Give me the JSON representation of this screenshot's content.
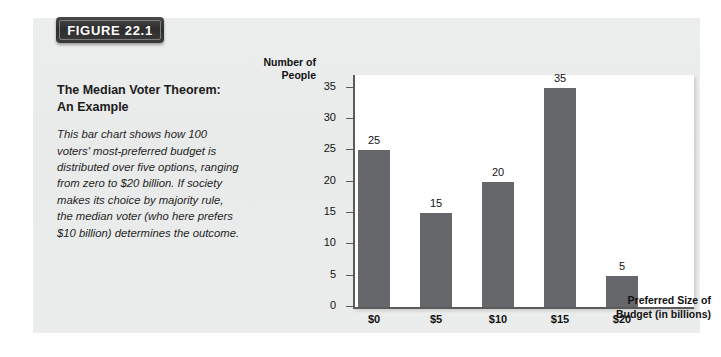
{
  "figure": {
    "badge_label": "FIGURE 22.1",
    "caption_title": "The Median Voter Theorem:\nAn Example",
    "caption_body": "This bar chart shows how 100 voters' most-preferred budget is distributed over five options, ranging from zero to $20 billion. If society makes its choice by majority rule, the median voter (who here prefers $10 billion) determines the outcome."
  },
  "chart_data": {
    "type": "bar",
    "title": "",
    "categories": [
      "$0",
      "$5",
      "$10",
      "$15",
      "$20"
    ],
    "values": [
      25,
      15,
      20,
      35,
      5
    ],
    "value_labels": [
      "25",
      "15",
      "20",
      "35",
      "5"
    ],
    "xlabel": "Preferred Size of\nBudget (in billions)",
    "ylabel": "Number of\nPeople",
    "ylim": [
      0,
      37
    ],
    "yticks": [
      0,
      5,
      10,
      15,
      20,
      25,
      30,
      35
    ],
    "ytick_labels": [
      "0",
      "5",
      "10",
      "15",
      "20",
      "25",
      "30",
      "35"
    ],
    "grid": false,
    "legend": "none",
    "bar_color": "#66676a",
    "axis_color": "#5b5b5b",
    "plot_background": "#ffffff",
    "panel_background": "#eceded"
  }
}
